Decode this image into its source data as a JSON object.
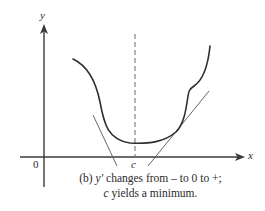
{
  "diagram": {
    "type": "function-graph",
    "axes": {
      "x_label": "x",
      "y_label": "y",
      "origin_label": "0"
    },
    "critical_point": {
      "label": "c",
      "marker": "dashed-vertical-line"
    },
    "curve": {
      "description": "Curve decreasing, reaching minimum at c, then increasing",
      "tangent_lines": [
        "left tangent with negative slope",
        "right tangent with positive slope"
      ]
    },
    "caption": {
      "part": "(b)",
      "line1_prefix": "(b) ",
      "line1_var": "y′",
      "line1_rest": " changes from – to 0 to +;",
      "line2_var": "c",
      "line2_rest": " yields a minimum."
    },
    "colors": {
      "curve": "#2e2e2e",
      "axes": "#3a3a3a",
      "tangent": "#555555",
      "dashed": "#6a6a6a",
      "background": "#ffffff"
    }
  }
}
